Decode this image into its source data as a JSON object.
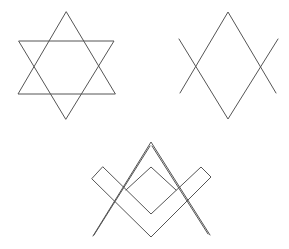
{
  "figure": {
    "stroke_color": "#555555",
    "background": "#ffffff",
    "symbols": [
      {
        "name": "hexagram",
        "triangles": [
          [
            [
              66,
              12
            ],
            [
              18,
              94
            ],
            [
              115,
              94
            ]
          ],
          [
            [
              19,
              41
            ],
            [
              114,
              41
            ],
            [
              66,
              119
            ]
          ]
        ]
      },
      {
        "name": "crossed-diamond",
        "lines": [
          [
            [
              179,
              39
            ],
            [
              228,
              119
            ],
            [
              278,
              39
            ]
          ],
          [
            [
              180,
              93
            ],
            [
              228,
              12
            ],
            [
              276,
              93
            ]
          ]
        ]
      },
      {
        "name": "square-and-compass",
        "compass": [
          [
            93,
            236
          ],
          [
            151,
            142
          ],
          [
            209,
            235
          ]
        ],
        "square": [
          [
            103,
            167
          ],
          [
            151,
            214
          ],
          [
            201,
            167
          ],
          [
            211,
            177
          ],
          [
            151,
            237
          ],
          [
            92,
            179
          ],
          [
            103,
            167
          ]
        ],
        "inner_diamond_top": [
          151,
          167
        ]
      }
    ]
  }
}
